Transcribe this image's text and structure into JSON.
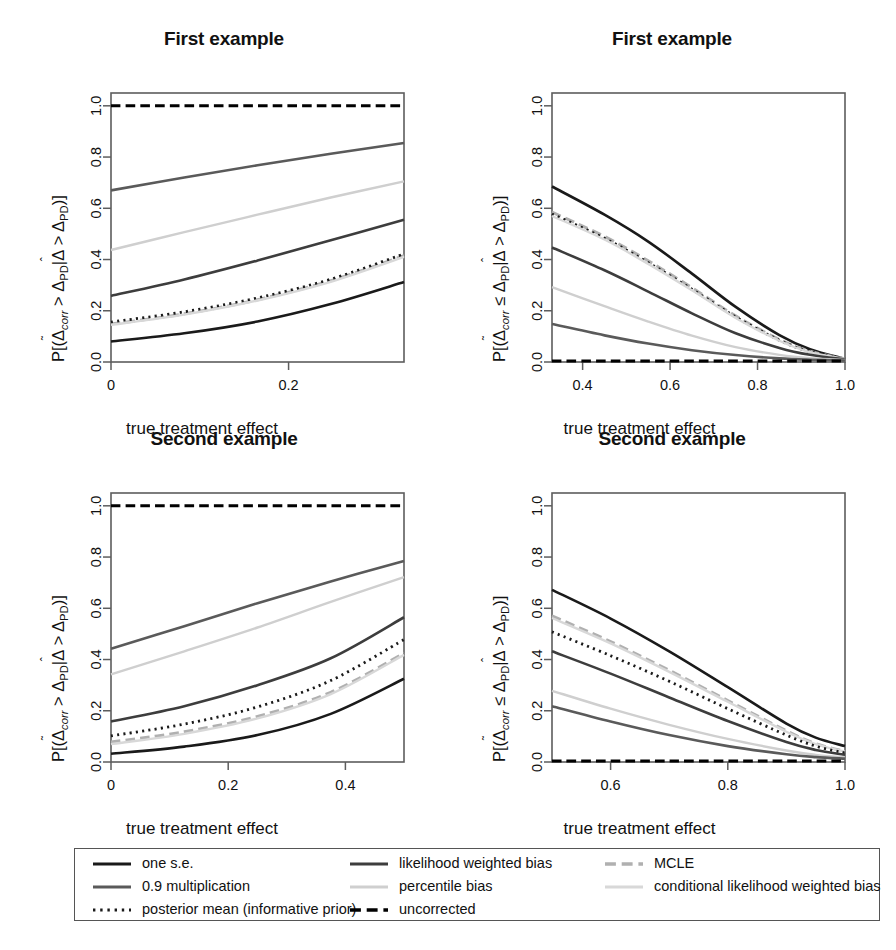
{
  "figure": {
    "width": 896,
    "height": 950,
    "xlabel": "true treatment effect"
  },
  "series_styles": {
    "one_se": {
      "color": "#1a1a1a",
      "dash": "none",
      "width": 2.6
    },
    "mult09": {
      "color": "#5a5a5a",
      "dash": "none",
      "width": 2.6
    },
    "posterior": {
      "color": "#1a1a1a",
      "dash": "dotted",
      "width": 2.8
    },
    "lwb": {
      "color": "#3d3d3d",
      "dash": "none",
      "width": 2.6
    },
    "percentile": {
      "color": "#cfcfcf",
      "dash": "none",
      "width": 2.4
    },
    "uncorrected": {
      "color": "#000000",
      "dash": "dashed",
      "width": 3.0
    },
    "mcle": {
      "color": "#b0b0b0",
      "dash": "dashed",
      "width": 3.0
    },
    "clwb": {
      "color": "#d8d8d8",
      "dash": "none",
      "width": 2.4
    }
  },
  "legend": {
    "columns": [
      {
        "entries": [
          {
            "key": "one_se",
            "label": "one s.e."
          },
          {
            "key": "mult09",
            "label": "0.9 multiplication"
          },
          {
            "key": "posterior",
            "label": "posterior mean (informative prior)"
          }
        ]
      },
      {
        "entries": [
          {
            "key": "lwb",
            "label": "likelihood weighted bias"
          },
          {
            "key": "percentile",
            "label": "percentile bias"
          },
          {
            "key": "uncorrected",
            "label": "uncorrected"
          }
        ]
      },
      {
        "entries": [
          {
            "key": "mcle",
            "label": "MCLE"
          },
          {
            "key": "clwb",
            "label": "conditional likelihood weighted bias"
          }
        ]
      }
    ]
  },
  "chart_data": [
    {
      "id": "top-left",
      "type": "line",
      "title": "First example",
      "xlabel": "true treatment effect",
      "ylabel": "P[(Δ̃corr > ΔPD|Δ̂ > ΔPD)]",
      "ylabel_parts": {
        "prefix": "P[(",
        "sym1": "Δ",
        "sub1": "corr",
        "rel": " > ",
        "sym2": "Δ",
        "sub2": "PD",
        "bar": "|",
        "sym3": "Δ",
        "rel2": " > ",
        "sym4": "Δ",
        "sub4": "PD",
        "suffix": ")]"
      },
      "relation": ">",
      "xlim": [
        0,
        0.33
      ],
      "ylim": [
        0,
        1.05
      ],
      "xticks": [
        0,
        0.2
      ],
      "xticklabels": [
        "0",
        "0.2"
      ],
      "yticks": [
        0.0,
        0.2,
        0.4,
        0.6,
        0.8,
        1.0
      ],
      "yticklabels": [
        "0.0",
        "0.2",
        "0.4",
        "0.6",
        "0.8",
        "1.0"
      ],
      "grid": false,
      "series": [
        {
          "key": "uncorrected",
          "name": "uncorrected",
          "x": [
            0,
            0.0825,
            0.165,
            0.2475,
            0.33
          ],
          "values": [
            1.0,
            1.0,
            1.0,
            1.0,
            1.0
          ]
        },
        {
          "key": "mult09",
          "name": "0.9 multiplication",
          "x": [
            0,
            0.0825,
            0.165,
            0.2475,
            0.33
          ],
          "values": [
            0.67,
            0.72,
            0.768,
            0.813,
            0.855
          ]
        },
        {
          "key": "percentile",
          "name": "percentile bias",
          "x": [
            0,
            0.0825,
            0.165,
            0.2475,
            0.33
          ],
          "values": [
            0.437,
            0.507,
            0.575,
            0.642,
            0.705
          ]
        },
        {
          "key": "lwb",
          "name": "likelihood weighted bias",
          "x": [
            0,
            0.0825,
            0.165,
            0.2475,
            0.33
          ],
          "values": [
            0.258,
            0.322,
            0.396,
            0.475,
            0.555
          ]
        },
        {
          "key": "mcle",
          "name": "MCLE",
          "x": [
            0,
            0.0825,
            0.165,
            0.2475,
            0.33
          ],
          "values": [
            0.148,
            0.188,
            0.243,
            0.317,
            0.415
          ]
        },
        {
          "key": "posterior",
          "name": "posterior mean (informative prior)",
          "x": [
            0,
            0.0825,
            0.165,
            0.2475,
            0.33
          ],
          "values": [
            0.156,
            0.196,
            0.25,
            0.323,
            0.422
          ]
        },
        {
          "key": "clwb",
          "name": "conditional likelihood weighted bias",
          "x": [
            0,
            0.0825,
            0.165,
            0.2475,
            0.33
          ],
          "values": [
            0.145,
            0.185,
            0.24,
            0.313,
            0.41
          ]
        },
        {
          "key": "one_se",
          "name": "one s.e.",
          "x": [
            0,
            0.0825,
            0.165,
            0.2475,
            0.33
          ],
          "values": [
            0.08,
            0.112,
            0.158,
            0.226,
            0.312
          ]
        }
      ]
    },
    {
      "id": "top-right",
      "type": "line",
      "title": "First example",
      "xlabel": "true treatment effect",
      "ylabel": "P[(Δ̃corr ≤ ΔPD|Δ̂ > ΔPD)]",
      "relation": "≤",
      "xlim": [
        0.33,
        1.0
      ],
      "ylim": [
        0,
        1.05
      ],
      "xticks": [
        0.4,
        0.6,
        0.8,
        1.0
      ],
      "xticklabels": [
        "0.4",
        "0.6",
        "0.8",
        "1.0"
      ],
      "yticks": [
        0.0,
        0.2,
        0.4,
        0.6,
        0.8,
        1.0
      ],
      "yticklabels": [
        "0.0",
        "0.2",
        "0.4",
        "0.6",
        "0.8",
        "1.0"
      ],
      "grid": false,
      "series": [
        {
          "key": "one_se",
          "name": "one s.e.",
          "x": [
            0.33,
            0.45,
            0.55,
            0.65,
            0.75,
            0.85,
            0.92,
            1.0
          ],
          "values": [
            0.685,
            0.575,
            0.47,
            0.345,
            0.215,
            0.105,
            0.05,
            0.012
          ]
        },
        {
          "key": "mcle",
          "name": "MCLE",
          "x": [
            0.33,
            0.45,
            0.55,
            0.65,
            0.75,
            0.85,
            0.92,
            1.0
          ],
          "values": [
            0.585,
            0.49,
            0.395,
            0.29,
            0.18,
            0.088,
            0.042,
            0.012
          ]
        },
        {
          "key": "posterior",
          "name": "posterior mean (informative prior)",
          "x": [
            0.33,
            0.45,
            0.55,
            0.65,
            0.75,
            0.85,
            0.92,
            1.0
          ],
          "values": [
            0.578,
            0.483,
            0.388,
            0.284,
            0.176,
            0.085,
            0.04,
            0.012
          ]
        },
        {
          "key": "clwb",
          "name": "conditional likelihood weighted bias",
          "x": [
            0.33,
            0.45,
            0.55,
            0.65,
            0.75,
            0.85,
            0.92,
            1.0
          ],
          "values": [
            0.57,
            0.478,
            0.383,
            0.28,
            0.172,
            0.083,
            0.038,
            0.012
          ]
        },
        {
          "key": "lwb",
          "name": "likelihood weighted bias",
          "x": [
            0.33,
            0.45,
            0.55,
            0.65,
            0.75,
            0.85,
            0.92,
            1.0
          ],
          "values": [
            0.447,
            0.358,
            0.275,
            0.19,
            0.112,
            0.055,
            0.028,
            0.01
          ]
        },
        {
          "key": "percentile",
          "name": "percentile bias",
          "x": [
            0.33,
            0.45,
            0.55,
            0.65,
            0.75,
            0.85,
            0.92,
            1.0
          ],
          "values": [
            0.292,
            0.218,
            0.158,
            0.103,
            0.058,
            0.028,
            0.015,
            0.008
          ]
        },
        {
          "key": "mult09",
          "name": "0.9 multiplication",
          "x": [
            0.33,
            0.45,
            0.55,
            0.65,
            0.75,
            0.85,
            0.92,
            1.0
          ],
          "values": [
            0.148,
            0.104,
            0.072,
            0.046,
            0.027,
            0.014,
            0.009,
            0.006
          ]
        },
        {
          "key": "uncorrected",
          "name": "uncorrected",
          "x": [
            0.33,
            0.55,
            0.75,
            1.0
          ],
          "values": [
            0.004,
            0.004,
            0.004,
            0.004
          ]
        }
      ]
    },
    {
      "id": "bottom-left",
      "type": "line",
      "title": "Second example",
      "xlabel": "true treatment effect",
      "ylabel": "P[(Δ̃corr > ΔPD|Δ̂ > ΔPD)]",
      "relation": ">",
      "xlim": [
        0,
        0.5
      ],
      "ylim": [
        0,
        1.05
      ],
      "xticks": [
        0,
        0.2,
        0.4
      ],
      "xticklabels": [
        "0",
        "0.2",
        "0.4"
      ],
      "yticks": [
        0.0,
        0.2,
        0.4,
        0.6,
        0.8,
        1.0
      ],
      "yticklabels": [
        "0.0",
        "0.2",
        "0.4",
        "0.6",
        "0.8",
        "1.0"
      ],
      "grid": false,
      "series": [
        {
          "key": "uncorrected",
          "name": "uncorrected",
          "x": [
            0,
            0.125,
            0.25,
            0.375,
            0.5
          ],
          "values": [
            1.0,
            1.0,
            1.0,
            1.0,
            1.0
          ]
        },
        {
          "key": "mult09",
          "name": "0.9 multiplication",
          "x": [
            0,
            0.125,
            0.25,
            0.375,
            0.5
          ],
          "values": [
            0.442,
            0.53,
            0.62,
            0.705,
            0.785
          ]
        },
        {
          "key": "percentile",
          "name": "percentile bias",
          "x": [
            0,
            0.125,
            0.25,
            0.375,
            0.5
          ],
          "values": [
            0.342,
            0.432,
            0.525,
            0.625,
            0.722
          ]
        },
        {
          "key": "lwb",
          "name": "likelihood weighted bias",
          "x": [
            0,
            0.125,
            0.25,
            0.375,
            0.5
          ],
          "values": [
            0.158,
            0.218,
            0.3,
            0.405,
            0.565
          ]
        },
        {
          "key": "posterior",
          "name": "posterior mean (informative prior)",
          "x": [
            0,
            0.125,
            0.25,
            0.375,
            0.5
          ],
          "values": [
            0.102,
            0.148,
            0.215,
            0.318,
            0.478
          ]
        },
        {
          "key": "mcle",
          "name": "MCLE",
          "x": [
            0,
            0.125,
            0.25,
            0.375,
            0.5
          ],
          "values": [
            0.078,
            0.118,
            0.178,
            0.272,
            0.425
          ]
        },
        {
          "key": "clwb",
          "name": "conditional likelihood weighted bias",
          "x": [
            0,
            0.125,
            0.25,
            0.375,
            0.5
          ],
          "values": [
            0.07,
            0.11,
            0.17,
            0.265,
            0.418
          ]
        },
        {
          "key": "one_se",
          "name": "one s.e.",
          "x": [
            0,
            0.125,
            0.25,
            0.375,
            0.5
          ],
          "values": [
            0.032,
            0.06,
            0.105,
            0.188,
            0.325
          ]
        }
      ]
    },
    {
      "id": "bottom-right",
      "type": "line",
      "title": "Second example",
      "xlabel": "true treatment effect",
      "ylabel": "P[(Δ̃corr ≤ ΔPD|Δ̂ > ΔPD)]",
      "relation": "≤",
      "xlim": [
        0.5,
        1.0
      ],
      "ylim": [
        0,
        1.05
      ],
      "xticks": [
        0.6,
        0.8,
        1.0
      ],
      "xticklabels": [
        "0.6",
        "0.8",
        "1.0"
      ],
      "yticks": [
        0.0,
        0.2,
        0.4,
        0.6,
        0.8,
        1.0
      ],
      "yticklabels": [
        "0.0",
        "0.2",
        "0.4",
        "0.6",
        "0.8",
        "1.0"
      ],
      "grid": false,
      "series": [
        {
          "key": "one_se",
          "name": "one s.e.",
          "x": [
            0.5,
            0.6,
            0.7,
            0.8,
            0.9,
            0.95,
            1.0
          ],
          "values": [
            0.672,
            0.56,
            0.432,
            0.292,
            0.15,
            0.095,
            0.062
          ]
        },
        {
          "key": "mcle",
          "name": "MCLE",
          "x": [
            0.5,
            0.6,
            0.7,
            0.8,
            0.9,
            0.95,
            1.0
          ],
          "values": [
            0.57,
            0.47,
            0.358,
            0.24,
            0.122,
            0.072,
            0.042
          ]
        },
        {
          "key": "clwb",
          "name": "conditional likelihood weighted bias",
          "x": [
            0.5,
            0.6,
            0.7,
            0.8,
            0.9,
            0.95,
            1.0
          ],
          "values": [
            0.562,
            0.463,
            0.352,
            0.235,
            0.118,
            0.07,
            0.04
          ]
        },
        {
          "key": "posterior",
          "name": "posterior mean (informative prior)",
          "x": [
            0.5,
            0.6,
            0.7,
            0.8,
            0.9,
            0.95,
            1.0
          ],
          "values": [
            0.508,
            0.415,
            0.315,
            0.208,
            0.105,
            0.062,
            0.035
          ]
        },
        {
          "key": "lwb",
          "name": "likelihood weighted bias",
          "x": [
            0.5,
            0.6,
            0.7,
            0.8,
            0.9,
            0.95,
            1.0
          ],
          "values": [
            0.432,
            0.345,
            0.252,
            0.16,
            0.078,
            0.047,
            0.028
          ]
        },
        {
          "key": "percentile",
          "name": "percentile bias",
          "x": [
            0.5,
            0.6,
            0.7,
            0.8,
            0.9,
            0.95,
            1.0
          ],
          "values": [
            0.278,
            0.208,
            0.145,
            0.09,
            0.045,
            0.028,
            0.018
          ]
        },
        {
          "key": "mult09",
          "name": "0.9 multiplication",
          "x": [
            0.5,
            0.6,
            0.7,
            0.8,
            0.9,
            0.95,
            1.0
          ],
          "values": [
            0.218,
            0.158,
            0.105,
            0.062,
            0.03,
            0.019,
            0.013
          ]
        },
        {
          "key": "uncorrected",
          "name": "uncorrected",
          "x": [
            0.5,
            0.7,
            0.9,
            1.0
          ],
          "values": [
            0.004,
            0.004,
            0.004,
            0.004
          ]
        }
      ]
    }
  ]
}
